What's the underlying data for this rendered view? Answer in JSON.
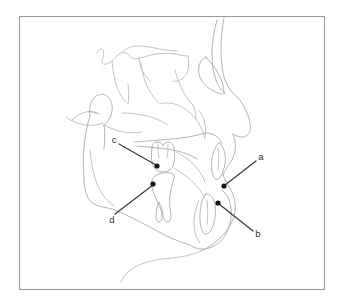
{
  "figure": {
    "kind": "cephalometric-tracing",
    "background_color": "#ffffff",
    "frame": {
      "stroke_color": "#9a9a9a",
      "x": 19,
      "y": 16,
      "width": 306,
      "height": 274
    },
    "tracing": {
      "stroke_color": "#a7a7a9",
      "secondary_stroke_color": "#b4b4b6",
      "stroke_width": 0.85
    },
    "annotation": {
      "leader_color": "#3b3b3b",
      "dot_color": "#151515",
      "label_color": "#2e2e2e",
      "dot_radius": 2.6
    },
    "labels": [
      {
        "id": "a",
        "text": "a",
        "label_x": 261,
        "label_y": 157,
        "dot_x": 224,
        "dot_y": 186,
        "line_x1": 256,
        "line_y1": 161,
        "line_x2": 225,
        "line_y2": 185
      },
      {
        "id": "b",
        "text": "b",
        "label_x": 258,
        "label_y": 234,
        "dot_x": 218,
        "dot_y": 203,
        "line_x1": 253,
        "line_y1": 231,
        "line_x2": 219,
        "line_y2": 204
      },
      {
        "id": "c",
        "text": "c",
        "label_x": 114,
        "label_y": 140,
        "dot_x": 157,
        "dot_y": 166,
        "line_x1": 119,
        "line_y1": 144,
        "line_x2": 156,
        "line_y2": 165
      },
      {
        "id": "d",
        "text": "d",
        "label_x": 112,
        "label_y": 220,
        "dot_x": 153,
        "dot_y": 184,
        "line_x1": 115,
        "line_y1": 214,
        "line_x2": 153,
        "line_y2": 185
      }
    ]
  }
}
